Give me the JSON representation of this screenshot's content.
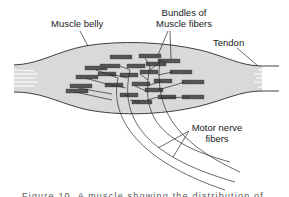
{
  "figure": {
    "labels": {
      "muscle_belly": "Muscle belly",
      "bundles_line1": "Bundles of",
      "bundles_line2": "Muscle fibers",
      "tendon": "Tendon",
      "motor_line1": "Motor nerve",
      "motor_line2": "fibers"
    },
    "caption_partial": "Figure 10.  A muscle showing the distribution of"
  },
  "colors": {
    "muscle_fill": "#d9d9d9",
    "outline": "#2a2a2a",
    "fiber_bundle": "#5a5a5a",
    "background": "#ffffff"
  }
}
